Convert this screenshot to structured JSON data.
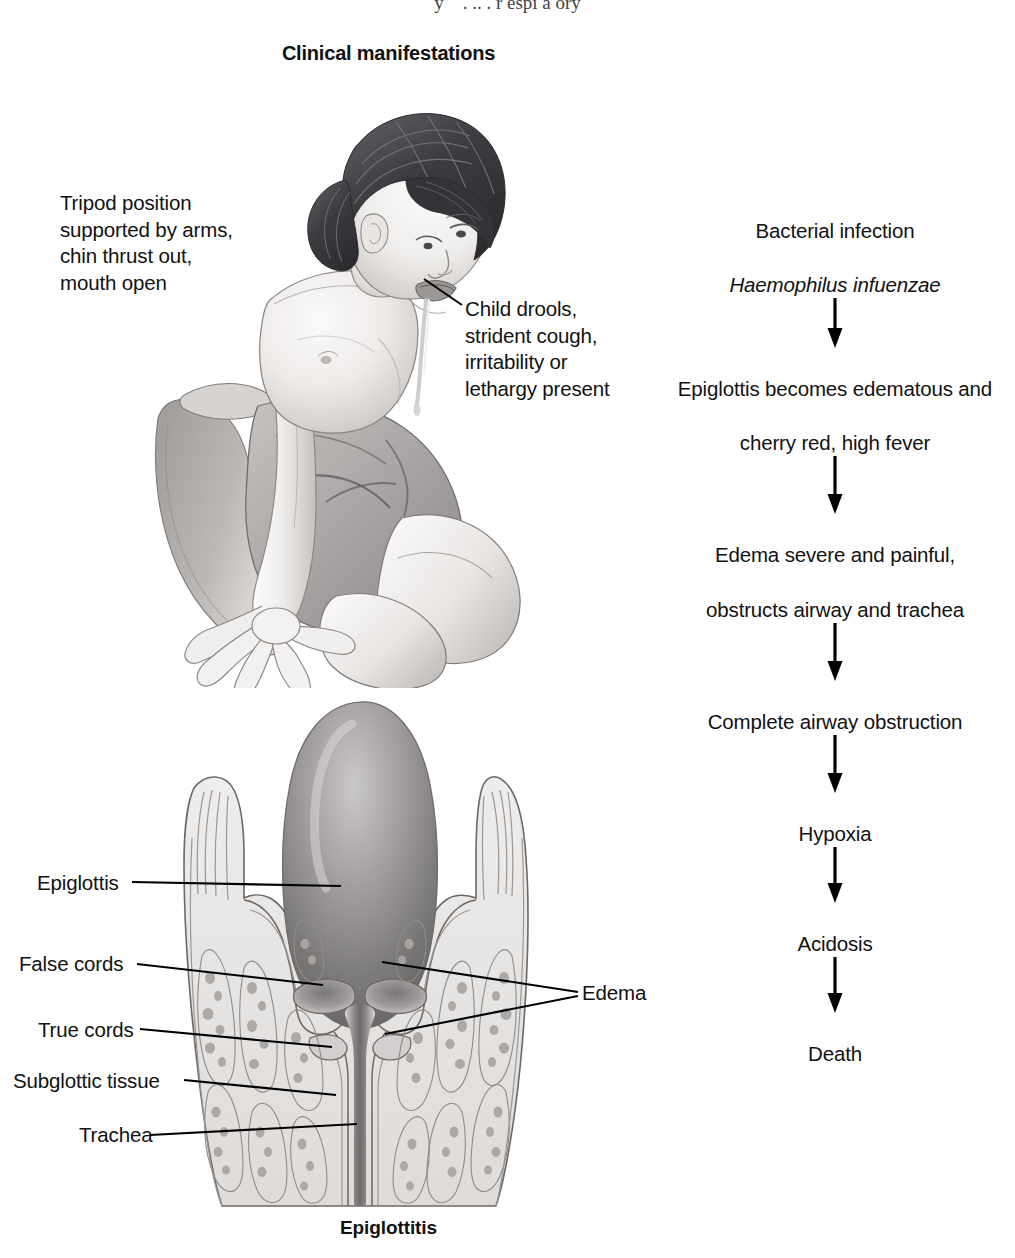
{
  "page": {
    "top_cutoff_text": "y    . .. . r espi a ory",
    "title": "Clinical manifestations",
    "caption": "Epiglottitis"
  },
  "child_figure": {
    "annotations": [
      {
        "name": "tripod-position",
        "text": "Tripod position\nsupported by arms,\nchin thrust out,\nmouth open"
      },
      {
        "name": "child-drools",
        "text": "Child drools,\nstrident cough,\nirritability or\nlethargy present"
      }
    ]
  },
  "larynx_figure": {
    "labels": [
      {
        "name": "epiglottis",
        "text": "Epiglottis"
      },
      {
        "name": "false-cords",
        "text": "False cords"
      },
      {
        "name": "true-cords",
        "text": "True cords"
      },
      {
        "name": "subglottic-tissue",
        "text": "Subglottic tissue"
      },
      {
        "name": "trachea",
        "text": "Trachea"
      },
      {
        "name": "edema",
        "text": "Edema"
      }
    ]
  },
  "flowchart": {
    "nodes": [
      {
        "line1": "Bacterial infection",
        "line2": "Haemophilus infuenzae",
        "line2_italic": true
      },
      {
        "line1": "Epiglottis becomes edematous and",
        "line2": "cherry red, high fever",
        "line2_italic": false
      },
      {
        "line1": "Edema severe and painful,",
        "line2": "obstructs airway and trachea",
        "line2_italic": false
      },
      {
        "line1": "Complete airway obstruction",
        "line2": "",
        "line2_italic": false
      },
      {
        "line1": "Hypoxia",
        "line2": "",
        "line2_italic": false
      },
      {
        "line1": "Acidosis",
        "line2": "",
        "line2_italic": false
      },
      {
        "line1": "Death",
        "line2": "",
        "line2_italic": false
      }
    ],
    "arrow_icon": "arrow-down-icon",
    "arrow_count": 6
  },
  "colors": {
    "text": "#111111",
    "line": "#000000",
    "background": "#ffffff",
    "skin_light": "#f4f2f1",
    "skin_mid": "#d9d6d4",
    "skin_shadow": "#b6b2af",
    "hair_dark": "#3a3a3c",
    "hair_light": "#6e6e72",
    "shorts_gray": "#a9a6a4",
    "cartilage_light": "#eceae8",
    "cartilage_mid": "#cfcccb",
    "epiglottis_dark": "#8d8a89",
    "epiglottis_darker": "#6f6d6c",
    "outline": "#6b6866"
  }
}
